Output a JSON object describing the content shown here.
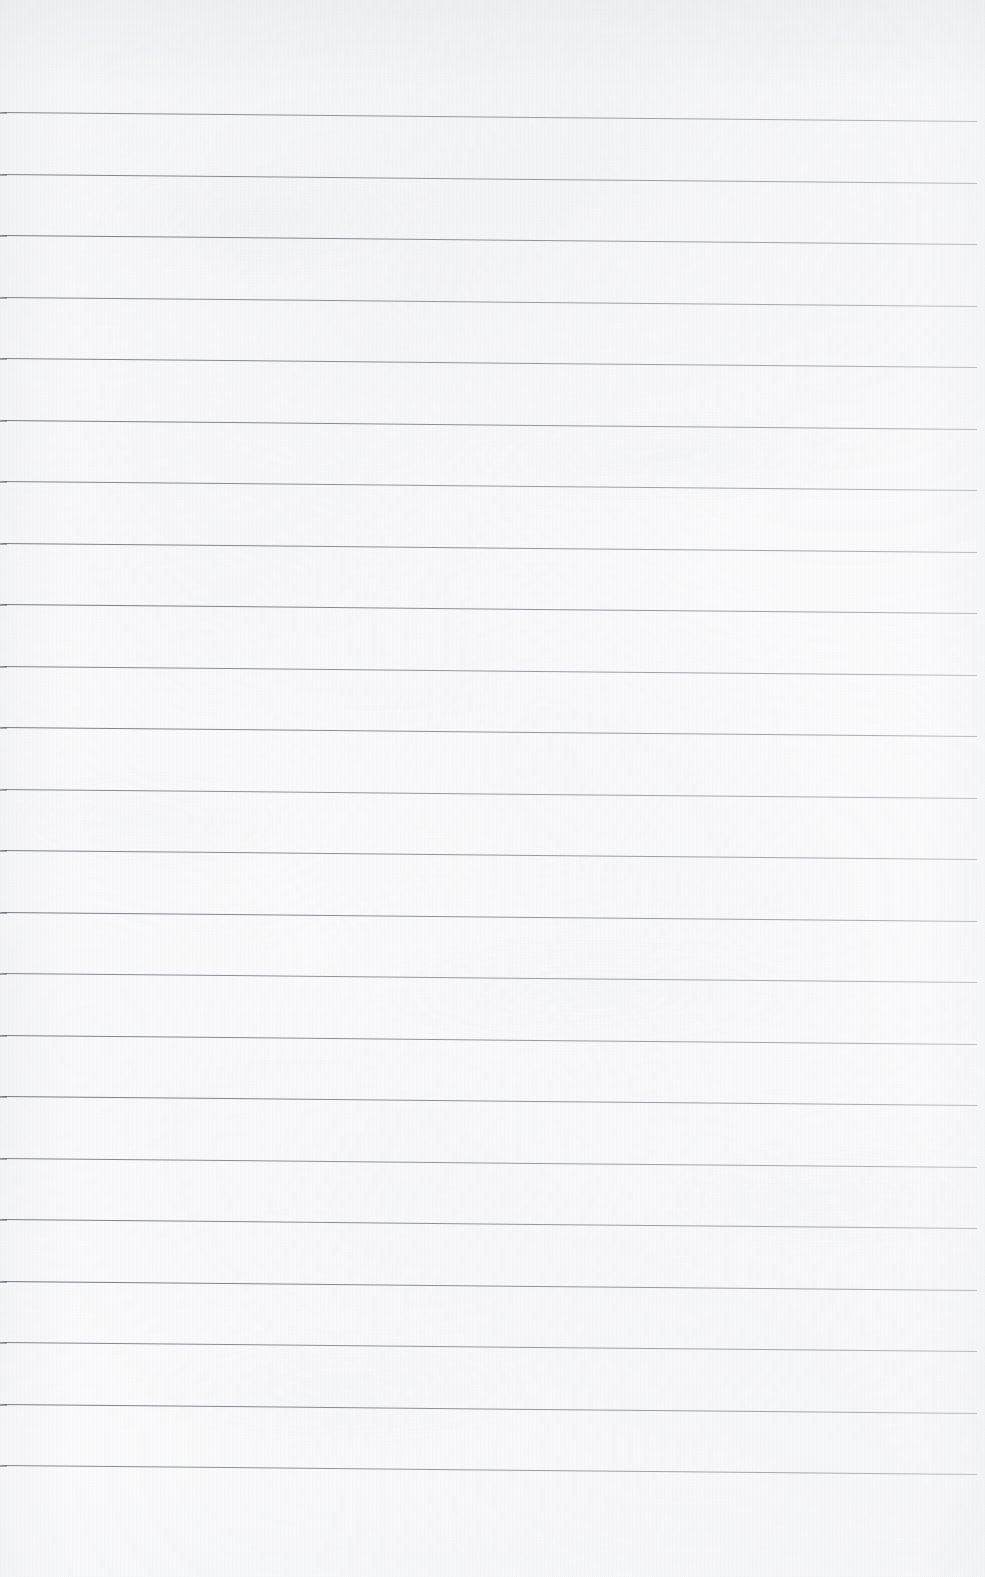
{
  "document": {
    "kind": "scanned-lined-notebook-page",
    "title": "Lined Notebook Page",
    "content_text": "",
    "is_blank": true,
    "page_width_px": 985,
    "page_height_px": 1577
  },
  "paper": {
    "background_color": "#fbfbfc",
    "texture_tint": "#c8ccd4",
    "top_shadow_color": "#e8eaee"
  },
  "ruling": {
    "line_color": "#6c7078",
    "line_thickness_px": 1,
    "line_count": 23,
    "first_line_y_px": 112,
    "line_spacing_px": 61.5,
    "left_inset_px": 0,
    "right_end_px": 977,
    "slope_px_over_width": 9,
    "lines_y_px": [
      112,
      173.5,
      235,
      296.5,
      358,
      419.5,
      481,
      542.5,
      604,
      665.5,
      727,
      788.5,
      850,
      911.5,
      973,
      1034.5,
      1096,
      1157.5,
      1219,
      1280.5,
      1342,
      1403.5,
      1465
    ]
  },
  "margins": {
    "top_blank_px": 112,
    "bottom_blank_px": 112,
    "has_vertical_margin_rule": false,
    "has_holes": false,
    "has_header_text": false
  }
}
